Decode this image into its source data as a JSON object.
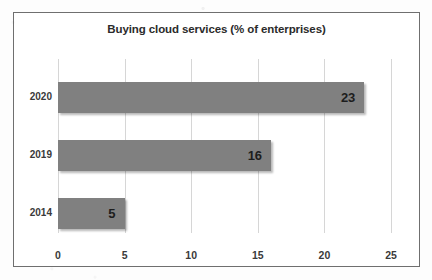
{
  "chart_data": {
    "type": "bar",
    "orientation": "horizontal",
    "title": "Buying cloud services (% of enterprises)",
    "xlabel": "",
    "ylabel": "",
    "categories": [
      "2020",
      "2019",
      "2014"
    ],
    "values": [
      23,
      16,
      5
    ],
    "data_labels": [
      "23",
      "16",
      "5"
    ],
    "xlim": [
      0,
      25
    ],
    "xticks": [
      "0",
      "5",
      "10",
      "15",
      "20",
      "25"
    ],
    "grid": "vertical",
    "legend": "none",
    "series": [
      {
        "name": "% of enterprises",
        "values": [
          23,
          16,
          5
        ]
      }
    ],
    "colors": {
      "bar": "#808080",
      "gridline": "#d6d6d6",
      "axis": "#9a9a9a",
      "frame": "#6f6f6f",
      "text": "#2b2b2b",
      "background": "#ffffff"
    }
  }
}
